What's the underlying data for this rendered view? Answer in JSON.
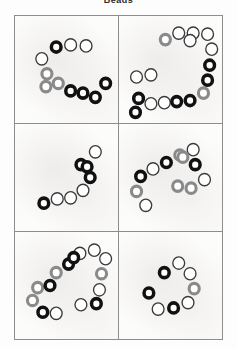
{
  "figure": {
    "title": "Beads",
    "width": 237,
    "height": 348,
    "background_color": "#fdfdfd",
    "panel_background_color": "#fcfcfb",
    "panel_border_color": "#8d8d8d",
    "grid": {
      "rows": 3,
      "columns": 2,
      "total_panels": 6
    }
  },
  "legend": {
    "marker_shape": "ring",
    "categories": [
      {
        "name": "black",
        "stroke_color": "#111111",
        "fill_color": "#ffffff",
        "stroke_width": 3.4
      },
      {
        "name": "gray",
        "stroke_color": "#8a8a8a",
        "fill_color": "#ffffff",
        "stroke_width": 3.0
      },
      {
        "name": "white",
        "stroke_color": "#3a3a3a",
        "fill_color": "#ffffff",
        "stroke_width": 1.3
      }
    ]
  },
  "chart_data": {
    "type": "scatter",
    "title": "Beads",
    "xlabel": "",
    "ylabel": "",
    "xlim": [
      0,
      100
    ],
    "ylim": [
      0,
      100
    ],
    "grid": false,
    "legend_position": "none",
    "panel_layout": {
      "rows": 3,
      "columns": 2
    },
    "marker_radius": 6.4,
    "panels": [
      {
        "id": "panel-1",
        "label": "top-left",
        "row": 1,
        "column": 1,
        "bead_count": 11,
        "beads": [
          {
            "x": 40,
            "y": 29,
            "color": "black"
          },
          {
            "x": 54,
            "y": 27,
            "color": "white"
          },
          {
            "x": 69,
            "y": 28,
            "color": "white"
          },
          {
            "x": 26,
            "y": 40,
            "color": "white"
          },
          {
            "x": 31,
            "y": 54,
            "color": "gray"
          },
          {
            "x": 42,
            "y": 63,
            "color": "gray"
          },
          {
            "x": 54,
            "y": 70,
            "color": "black"
          },
          {
            "x": 66,
            "y": 72,
            "color": "black"
          },
          {
            "x": 78,
            "y": 76,
            "color": "black"
          },
          {
            "x": 88,
            "y": 63,
            "color": "black"
          },
          {
            "x": 30,
            "y": 66,
            "color": "gray"
          }
        ]
      },
      {
        "id": "panel-2",
        "label": "top-right",
        "row": 1,
        "column": 2,
        "bead_count": 17,
        "beads": [
          {
            "x": 45,
            "y": 22,
            "color": "gray"
          },
          {
            "x": 58,
            "y": 16,
            "color": "white"
          },
          {
            "x": 72,
            "y": 16,
            "color": "white"
          },
          {
            "x": 86,
            "y": 17,
            "color": "white"
          },
          {
            "x": 90,
            "y": 31,
            "color": "white"
          },
          {
            "x": 88,
            "y": 46,
            "color": "black"
          },
          {
            "x": 86,
            "y": 60,
            "color": "black"
          },
          {
            "x": 82,
            "y": 72,
            "color": "gray"
          },
          {
            "x": 69,
            "y": 79,
            "color": "black"
          },
          {
            "x": 56,
            "y": 80,
            "color": "black"
          },
          {
            "x": 44,
            "y": 81,
            "color": "white"
          },
          {
            "x": 31,
            "y": 82,
            "color": "white"
          },
          {
            "x": 19,
            "y": 77,
            "color": "black"
          },
          {
            "x": 16,
            "y": 90,
            "color": "black"
          },
          {
            "x": 17,
            "y": 57,
            "color": "white"
          },
          {
            "x": 31,
            "y": 55,
            "color": "white"
          },
          {
            "x": 69,
            "y": 23,
            "color": "white"
          }
        ]
      },
      {
        "id": "panel-3",
        "label": "middle-left",
        "row": 2,
        "column": 1,
        "bead_count": 8,
        "beads": [
          {
            "x": 78,
            "y": 26,
            "color": "white"
          },
          {
            "x": 64,
            "y": 38,
            "color": "black"
          },
          {
            "x": 73,
            "y": 50,
            "color": "black"
          },
          {
            "x": 66,
            "y": 62,
            "color": "white"
          },
          {
            "x": 54,
            "y": 69,
            "color": "white"
          },
          {
            "x": 41,
            "y": 70,
            "color": "white"
          },
          {
            "x": 28,
            "y": 74,
            "color": "black"
          },
          {
            "x": 70,
            "y": 40,
            "color": "black"
          }
        ]
      },
      {
        "id": "panel-4",
        "label": "middle-right",
        "row": 2,
        "column": 2,
        "bead_count": 12,
        "beads": [
          {
            "x": 72,
            "y": 24,
            "color": "white"
          },
          {
            "x": 59,
            "y": 29,
            "color": "gray"
          },
          {
            "x": 46,
            "y": 36,
            "color": "black"
          },
          {
            "x": 33,
            "y": 42,
            "color": "white"
          },
          {
            "x": 21,
            "y": 49,
            "color": "black"
          },
          {
            "x": 17,
            "y": 63,
            "color": "gray"
          },
          {
            "x": 26,
            "y": 76,
            "color": "white"
          },
          {
            "x": 74,
            "y": 38,
            "color": "black"
          },
          {
            "x": 83,
            "y": 52,
            "color": "white"
          },
          {
            "x": 70,
            "y": 60,
            "color": "gray"
          },
          {
            "x": 57,
            "y": 58,
            "color": "gray"
          },
          {
            "x": 62,
            "y": 31,
            "color": "gray"
          }
        ]
      },
      {
        "id": "panel-5",
        "label": "bottom-left",
        "row": 3,
        "column": 1,
        "bead_count": 15,
        "beads": [
          {
            "x": 63,
            "y": 20,
            "color": "white"
          },
          {
            "x": 77,
            "y": 17,
            "color": "white"
          },
          {
            "x": 88,
            "y": 25,
            "color": "white"
          },
          {
            "x": 84,
            "y": 39,
            "color": "gray"
          },
          {
            "x": 82,
            "y": 54,
            "color": "white"
          },
          {
            "x": 79,
            "y": 67,
            "color": "black"
          },
          {
            "x": 64,
            "y": 68,
            "color": "white"
          },
          {
            "x": 52,
            "y": 30,
            "color": "black"
          },
          {
            "x": 40,
            "y": 38,
            "color": "gray"
          },
          {
            "x": 34,
            "y": 50,
            "color": "black"
          },
          {
            "x": 22,
            "y": 52,
            "color": "gray"
          },
          {
            "x": 17,
            "y": 64,
            "color": "gray"
          },
          {
            "x": 27,
            "y": 75,
            "color": "black"
          },
          {
            "x": 40,
            "y": 76,
            "color": "white"
          },
          {
            "x": 57,
            "y": 24,
            "color": "black"
          }
        ]
      },
      {
        "id": "panel-6",
        "label": "bottom-right",
        "row": 3,
        "column": 2,
        "bead_count": 8,
        "beads": [
          {
            "x": 58,
            "y": 29,
            "color": "white"
          },
          {
            "x": 44,
            "y": 38,
            "color": "black"
          },
          {
            "x": 69,
            "y": 39,
            "color": "white"
          },
          {
            "x": 73,
            "y": 53,
            "color": "gray"
          },
          {
            "x": 67,
            "y": 66,
            "color": "white"
          },
          {
            "x": 53,
            "y": 71,
            "color": "black"
          },
          {
            "x": 38,
            "y": 72,
            "color": "white"
          },
          {
            "x": 29,
            "y": 57,
            "color": "black"
          }
        ]
      }
    ]
  }
}
